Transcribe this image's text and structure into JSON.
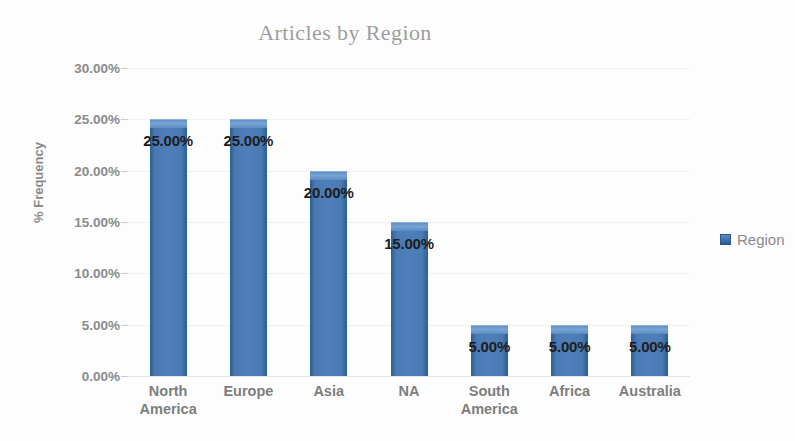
{
  "chart_data": {
    "type": "bar",
    "title": "Articles by Region",
    "xlabel": "",
    "ylabel": "% Frequency",
    "categories": [
      "North America",
      "Europe",
      "Asia",
      "NA",
      "South America",
      "Africa",
      "Australia"
    ],
    "values": [
      25.0,
      25.0,
      20.0,
      15.0,
      5.0,
      5.0,
      5.0
    ],
    "data_labels": [
      "25.00%",
      "25.00%",
      "20.00%",
      "15.00%",
      "5.00%",
      "5.00%",
      "5.00%"
    ],
    "ylim": [
      0,
      30
    ],
    "ytick_values": [
      0,
      5,
      10,
      15,
      20,
      25,
      30
    ],
    "ytick_labels": [
      "0.00%",
      "5.00%",
      "10.00%",
      "15.00%",
      "20.00%",
      "25.00%",
      "30.00%"
    ],
    "grid": true,
    "legend_position": "right",
    "series": [
      {
        "name": "Region",
        "values": [
          25.0,
          25.0,
          20.0,
          15.0,
          5.0,
          5.0,
          5.0
        ],
        "color": "#4a7ab4"
      }
    ],
    "colors": {
      "bar_fill": "#4a7ab4",
      "bar_edge": "#2d5d97",
      "bar_highlight": "#79a4d4",
      "title_text": "#9d9d9d",
      "axis_text": "#8b8b8b",
      "label_text": "#1c1c1c",
      "gridline": "#f0f0f0",
      "background": "#fdfdfd"
    }
  },
  "legend": {
    "entries": [
      {
        "label": "Region",
        "marker": "square-swatch"
      }
    ]
  }
}
